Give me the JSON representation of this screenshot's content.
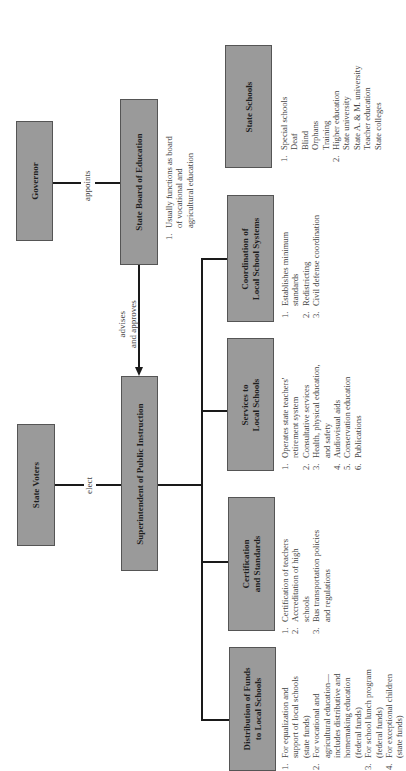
{
  "diagram": {
    "orientation": "rotated 90° counter-clockwise",
    "nodes": {
      "governor": {
        "label": "Governor"
      },
      "state_board": {
        "label": "State Board of Education",
        "notes": [
          {
            "n": "1.",
            "text": "Usually functions as board\nof vocational and\nagricultural education"
          }
        ]
      },
      "state_voters": {
        "label": "State Voters"
      },
      "superintendent": {
        "label": "Superintendent of Public Instruction"
      },
      "state_schools": {
        "label": "State Schools",
        "notes": [
          {
            "n": "1.",
            "text": "Special schools\nDeaf\nBlind\nOrphans\nTraining"
          },
          {
            "n": "2.",
            "text": "Higher education\nState university\nState A. & M. university\nTeacher education\nState colleges"
          }
        ]
      },
      "coordination": {
        "label_line1": "Coordination of",
        "label_line2": "Local School Systems",
        "notes": [
          {
            "n": "1.",
            "text": "Establishes minimum\nstandards"
          },
          {
            "n": "2.",
            "text": "Redistricting"
          },
          {
            "n": "3.",
            "text": "Civil defense coordination"
          }
        ]
      },
      "services": {
        "label_line1": "Services to",
        "label_line2": "Local Schools",
        "notes": [
          {
            "n": "1.",
            "text": "Operates state teachers'\nretirement system"
          },
          {
            "n": "2.",
            "text": "Consultative services"
          },
          {
            "n": "3.",
            "text": "Health, physical education,\nand safety"
          },
          {
            "n": "4.",
            "text": "Audiovisual aids"
          },
          {
            "n": "5.",
            "text": "Conservation education"
          },
          {
            "n": "6.",
            "text": "Publications"
          }
        ]
      },
      "certification": {
        "label_line1": "Certification",
        "label_line2": "and Standards",
        "notes": [
          {
            "n": "1.",
            "text": "Certification of teachers"
          },
          {
            "n": "2.",
            "text": "Accreditation of high\nschools"
          },
          {
            "n": "3.",
            "text": "Bus transportation policies\nand regulations"
          }
        ]
      },
      "distribution": {
        "label_line1": "Distribution of Funds",
        "label_line2": "to Local Schools",
        "notes": [
          {
            "n": "1.",
            "text": "For equalization and\nsupport of local schools\n(state funds)"
          },
          {
            "n": "2.",
            "text": "For vocational and\nagricultural education—\nincludes distributive and\nhomemaking education\n(federal funds)"
          },
          {
            "n": "3.",
            "text": "For school lunch program\n(federal funds)"
          },
          {
            "n": "4.",
            "text": "For exceptional children\n(state funds)"
          }
        ]
      }
    },
    "edges": {
      "appoints": "appoints",
      "elect": "elect",
      "advises_line1": "advises",
      "advises_line2": "and approves"
    },
    "colors": {
      "box_fill": "#9a9a9a",
      "line": "#1a1a1a",
      "background": "#ffffff"
    }
  }
}
